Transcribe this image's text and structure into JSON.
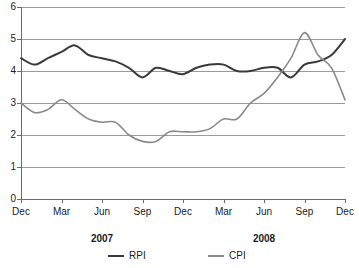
{
  "chart_data": {
    "type": "line",
    "title": "",
    "xlabel": "",
    "ylabel": "",
    "ylim": [
      0,
      6
    ],
    "y_ticks": [
      "0",
      "1",
      "2",
      "3",
      "4",
      "5",
      "6"
    ],
    "grid": true,
    "legend_position": "bottom",
    "x_tick_labels": [
      "Dec",
      "Mar",
      "Jun",
      "Sep",
      "Dec",
      "Mar",
      "Jun",
      "Sep",
      "Dec"
    ],
    "year_labels": [
      "2007",
      "2008"
    ],
    "x": [
      "Dec 2006",
      "Jan 2007",
      "Feb 2007",
      "Mar 2007",
      "Apr 2007",
      "May 2007",
      "Jun 2007",
      "Jul 2007",
      "Aug 2007",
      "Sep 2007",
      "Oct 2007",
      "Nov 2007",
      "Dec 2007",
      "Jan 2008",
      "Feb 2008",
      "Mar 2008",
      "Apr 2008",
      "May 2008",
      "Jun 2008",
      "Jul 2008",
      "Aug 2008",
      "Sep 2008",
      "Oct 2008",
      "Nov 2008",
      "Dec 2008"
    ],
    "series": [
      {
        "name": "RPI",
        "color": "#3a3a3a",
        "values": [
          4.4,
          4.2,
          4.4,
          4.6,
          4.8,
          4.5,
          4.4,
          4.3,
          4.1,
          3.8,
          4.1,
          4.0,
          3.9,
          4.1,
          4.2,
          4.2,
          4.0,
          4.0,
          4.1,
          4.1,
          3.8,
          4.2,
          4.3,
          4.5,
          5.0
        ],
        "end_value": 0.9,
        "peak_value": 5.0,
        "min_value": 0.9
      },
      {
        "name": "CPI",
        "color": "#8a8a8a",
        "values": [
          3.0,
          2.7,
          2.8,
          3.1,
          2.8,
          2.5,
          2.4,
          2.4,
          2.0,
          1.8,
          1.8,
          2.1,
          2.1,
          2.1,
          2.2,
          2.5,
          2.5,
          3.0,
          3.3,
          3.8,
          4.4,
          5.2,
          4.5,
          4.1,
          3.1
        ],
        "end_value": 3.1,
        "peak_value": 5.2,
        "min_value": 1.8
      }
    ]
  },
  "legend": {
    "items": [
      {
        "label": "RPI",
        "color": "#3a3a3a"
      },
      {
        "label": "CPI",
        "color": "#8a8a8a"
      }
    ]
  }
}
